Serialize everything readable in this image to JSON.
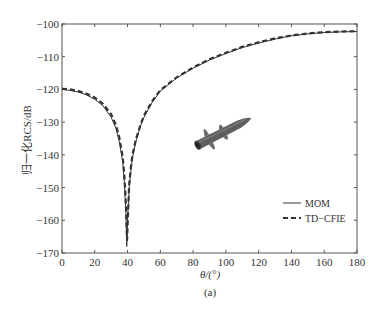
{
  "chart_data": {
    "type": "line",
    "title": "",
    "caption": "(a)",
    "xlabel": "θ/(°)",
    "ylabel": "归一化RCS/dB",
    "xlim": [
      0,
      180
    ],
    "ylim": [
      -170,
      -100
    ],
    "xticks": [
      0,
      20,
      40,
      60,
      80,
      100,
      120,
      140,
      160,
      180
    ],
    "yticks": [
      -100,
      -110,
      -120,
      -130,
      -140,
      -150,
      -160,
      -170
    ],
    "grid": false,
    "legend_position": "lower right",
    "series": [
      {
        "name": "MOM",
        "style": "solid",
        "color": "#333333",
        "x": [
          0,
          5,
          10,
          15,
          20,
          25,
          30,
          33,
          35,
          37,
          38,
          39,
          39.5,
          40,
          41,
          42,
          43,
          45,
          48,
          50,
          55,
          60,
          70,
          80,
          90,
          100,
          110,
          120,
          130,
          140,
          150,
          160,
          170,
          180
        ],
        "y": [
          -120,
          -120.3,
          -120.8,
          -121.7,
          -123,
          -125,
          -128.5,
          -132,
          -136,
          -142,
          -148,
          -158,
          -168,
          -160,
          -150,
          -145,
          -141,
          -136,
          -131,
          -128.5,
          -124,
          -120.5,
          -116.5,
          -113.5,
          -111,
          -109,
          -107.2,
          -105.8,
          -104.6,
          -103.6,
          -103,
          -102.6,
          -102.4,
          -102.3
        ]
      },
      {
        "name": "TD-CFIE",
        "style": "dashed",
        "color": "#333333",
        "x": [
          0,
          5,
          10,
          15,
          20,
          25,
          30,
          33,
          35,
          37,
          38,
          39,
          39.7,
          40.3,
          41,
          42,
          43,
          45,
          48,
          50,
          55,
          60,
          70,
          80,
          90,
          100,
          110,
          120,
          130,
          140,
          150,
          160,
          170,
          180
        ],
        "y": [
          -119.8,
          -120,
          -120.5,
          -121.3,
          -122.5,
          -124.4,
          -127.6,
          -131,
          -134.8,
          -140.5,
          -146,
          -155,
          -166,
          -158,
          -149,
          -144,
          -140,
          -135.5,
          -130.6,
          -128,
          -123.6,
          -120.2,
          -116.3,
          -113.3,
          -110.8,
          -108.8,
          -107,
          -105.6,
          -104.4,
          -103.5,
          -102.9,
          -102.5,
          -102.3,
          -102.2
        ]
      }
    ],
    "annotation": "missile-model-image"
  },
  "legend": {
    "items": [
      {
        "label": "MOM",
        "style": "solid"
      },
      {
        "label": "TD−CFIE",
        "style": "dashed"
      }
    ]
  },
  "axes": {
    "xlabel": "θ/(°)",
    "ylabel": "归一化RCS/dB",
    "caption": "(a)"
  }
}
